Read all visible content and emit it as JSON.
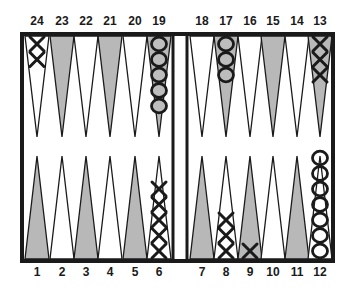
{
  "game": "Backgammon",
  "colors": {
    "frame": "#1a1a1a",
    "shaded_point": "#b8b8b8",
    "light_point": "#ffffff",
    "checker_stroke": "#1a1a1a",
    "checker_fill_o": "#bdbdbd"
  },
  "point_labels": {
    "top": [
      "24",
      "23",
      "22",
      "21",
      "20",
      "19",
      "18",
      "17",
      "16",
      "15",
      "14",
      "13"
    ],
    "bottom": [
      "1",
      "2",
      "3",
      "4",
      "5",
      "6",
      "7",
      "8",
      "9",
      "10",
      "11",
      "12"
    ]
  },
  "positions": {
    "X": {
      "24": 2,
      "13": 3,
      "8": 3,
      "9": 1,
      "6": 5
    },
    "O": {
      "19": 5,
      "17": 3,
      "12": 7
    }
  },
  "shaded_points": [
    23,
    21,
    19,
    17,
    15,
    13,
    1,
    3,
    5,
    7,
    9,
    11
  ]
}
